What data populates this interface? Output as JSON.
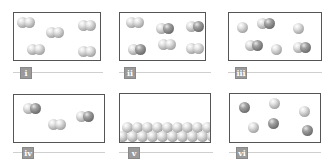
{
  "panels": [
    {
      "label": "i",
      "description": "5 diatomic molecules, same element"
    },
    {
      "label": "ii",
      "description": "6 diatomic molecules, mixed compound"
    },
    {
      "label": "iii",
      "description": "mixture of atoms and diatomic molecules"
    },
    {
      "label": "iv",
      "description": "3 diatomic molecules of compound"
    },
    {
      "label": "v",
      "description": "solid lattice of atoms at bottom"
    },
    {
      "label": "vi",
      "description": "6 single atoms of two kinds"
    }
  ],
  "colors": {
    "light_atom": "#c8c8c8",
    "dark_atom": "#7a7a7a",
    "border": "#555555",
    "label_bg": "#9a9a9a"
  }
}
